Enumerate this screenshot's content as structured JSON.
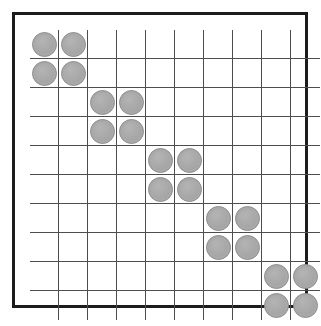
{
  "board": {
    "name": "grid-board",
    "columns": 10,
    "rows": 10,
    "cell_size_px": 29,
    "colors": {
      "background": "#ffffff",
      "outer_border": "#1c1c1c",
      "grid_line": "#4d4d4d",
      "disc_fill": "#a9a9a9",
      "disc_stroke": "#8f8f8f"
    },
    "piece_label": "gray disc",
    "empty_label": "empty cell",
    "blocks": [
      {
        "id": "block-1",
        "rows": [
          1,
          2
        ],
        "cols": [
          1,
          2
        ]
      },
      {
        "id": "block-2",
        "rows": [
          3,
          4
        ],
        "cols": [
          3,
          4
        ]
      },
      {
        "id": "block-3",
        "rows": [
          5,
          6
        ],
        "cols": [
          5,
          6
        ]
      },
      {
        "id": "block-4",
        "rows": [
          7,
          8
        ],
        "cols": [
          7,
          8
        ]
      },
      {
        "id": "block-5",
        "rows": [
          9,
          10
        ],
        "cols": [
          9,
          10
        ]
      }
    ],
    "occupied": [
      [
        1,
        1
      ],
      [
        1,
        2
      ],
      [
        2,
        1
      ],
      [
        2,
        2
      ],
      [
        3,
        3
      ],
      [
        3,
        4
      ],
      [
        4,
        3
      ],
      [
        4,
        4
      ],
      [
        5,
        5
      ],
      [
        5,
        6
      ],
      [
        6,
        5
      ],
      [
        6,
        6
      ],
      [
        7,
        7
      ],
      [
        7,
        8
      ],
      [
        8,
        7
      ],
      [
        8,
        8
      ],
      [
        9,
        9
      ],
      [
        9,
        10
      ],
      [
        10,
        9
      ],
      [
        10,
        10
      ]
    ],
    "piece_count": 20,
    "total_cells": 100
  }
}
